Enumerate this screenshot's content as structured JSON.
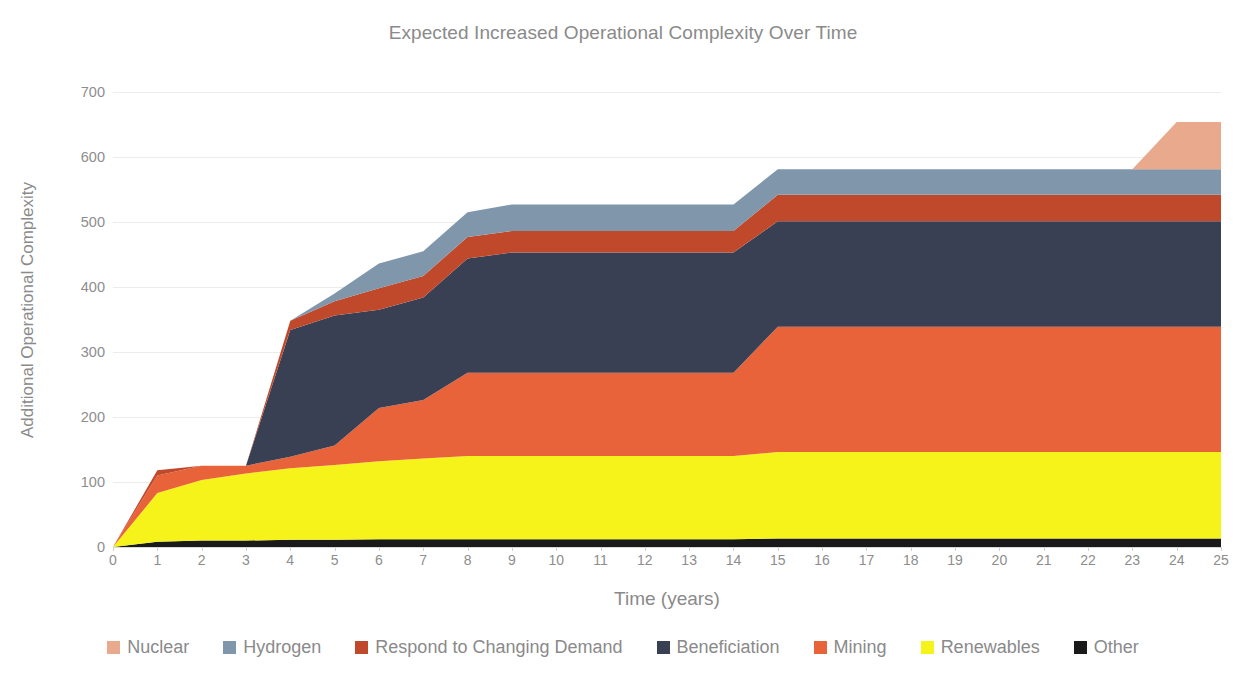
{
  "chart_data": {
    "type": "area",
    "stacked": true,
    "title": "Expected Increased Operational Complexity Over Time",
    "xlabel": "Time (years)",
    "ylabel": "Additional Operational Complexity",
    "xlim": [
      0,
      25
    ],
    "ylim": [
      0,
      700
    ],
    "grid": true,
    "legend_position": "bottom",
    "xticks": [
      "0",
      "1",
      "2",
      "3",
      "4",
      "5",
      "6",
      "7",
      "8",
      "9",
      "10",
      "11",
      "12",
      "13",
      "14",
      "15",
      "16",
      "17",
      "18",
      "19",
      "20",
      "21",
      "22",
      "23",
      "24",
      "25"
    ],
    "yticks": [
      "0",
      "100",
      "200",
      "300",
      "400",
      "500",
      "600",
      "700"
    ],
    "x": [
      0,
      1,
      2,
      3,
      4,
      5,
      6,
      7,
      8,
      9,
      10,
      11,
      12,
      13,
      14,
      15,
      16,
      17,
      18,
      19,
      20,
      21,
      22,
      23,
      24,
      25
    ],
    "stack_order_bottom_to_top": [
      "Other",
      "Renewables",
      "Mining",
      "Beneficiation",
      "Respond to Changing Demand",
      "Hydrogen",
      "Nuclear"
    ],
    "series": [
      {
        "name": "Other",
        "color": "#1a1a1a",
        "values": [
          0,
          8,
          10,
          10,
          11,
          11,
          12,
          12,
          12,
          12,
          12,
          12,
          12,
          12,
          12,
          13,
          13,
          13,
          13,
          13,
          13,
          13,
          13,
          13,
          13,
          13
        ]
      },
      {
        "name": "Renewables",
        "color": "#f5f319",
        "values": [
          0,
          75,
          93,
          103,
          110,
          115,
          120,
          124,
          128,
          128,
          128,
          128,
          128,
          128,
          128,
          133,
          133,
          133,
          133,
          133,
          133,
          133,
          133,
          133,
          133,
          133
        ]
      },
      {
        "name": "Mining",
        "color": "#e8633a",
        "values": [
          0,
          27,
          22,
          12,
          18,
          30,
          82,
          90,
          128,
          128,
          128,
          128,
          128,
          128,
          128,
          193,
          193,
          193,
          193,
          193,
          193,
          193,
          193,
          193,
          193,
          193
        ]
      },
      {
        "name": "Beneficiation",
        "color": "#3a4053",
        "values": [
          0,
          0,
          0,
          0,
          195,
          200,
          151,
          158,
          176,
          185,
          185,
          185,
          185,
          185,
          185,
          162,
          162,
          162,
          162,
          162,
          162,
          162,
          162,
          162,
          162,
          162
        ]
      },
      {
        "name": "Respond to Changing Demand",
        "color": "#c0492c",
        "values": [
          0,
          8,
          0,
          0,
          14,
          22,
          33,
          33,
          33,
          33,
          33,
          33,
          33,
          33,
          33,
          41,
          41,
          41,
          41,
          41,
          41,
          41,
          41,
          41,
          41,
          41
        ]
      },
      {
        "name": "Hydrogen",
        "color": "#8096ab",
        "values": [
          0,
          0,
          0,
          0,
          0,
          12,
          38,
          38,
          38,
          41,
          41,
          41,
          41,
          41,
          41,
          39,
          39,
          39,
          39,
          39,
          39,
          39,
          39,
          39,
          39,
          39
        ]
      },
      {
        "name": "Nuclear",
        "color": "#e8a98c",
        "values": [
          0,
          0,
          0,
          0,
          0,
          0,
          0,
          0,
          0,
          0,
          0,
          0,
          0,
          0,
          0,
          0,
          0,
          0,
          0,
          0,
          0,
          0,
          0,
          0,
          73,
          73
        ]
      }
    ],
    "totals": [
      0,
      118,
      125,
      125,
      348,
      390,
      436,
      455,
      515,
      527,
      527,
      527,
      527,
      527,
      527,
      581,
      581,
      581,
      581,
      581,
      581,
      581,
      581,
      581,
      654,
      654
    ]
  },
  "legend": {
    "items": [
      {
        "label": "Nuclear",
        "color": "#e8a98c"
      },
      {
        "label": "Hydrogen",
        "color": "#8096ab"
      },
      {
        "label": "Respond to Changing Demand",
        "color": "#c0492c"
      },
      {
        "label": "Beneficiation",
        "color": "#3a4053"
      },
      {
        "label": "Mining",
        "color": "#e8633a"
      },
      {
        "label": "Renewables",
        "color": "#f5f319"
      },
      {
        "label": "Other",
        "color": "#1a1a1a"
      }
    ]
  },
  "colors": {
    "grid": "#ececec",
    "axis_text": "#8d8d8d",
    "title_text": "#8a8a8a",
    "background": "#ffffff"
  }
}
